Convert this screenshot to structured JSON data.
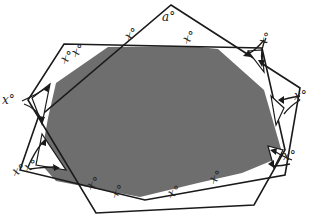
{
  "figure": {
    "overlap_color": "#6e6e6e",
    "line_color": "#1a1a1a",
    "background": "#ffffff"
  },
  "labels": {
    "apex": "a°",
    "top_left_pair": "x°x°",
    "top_right": "x°",
    "upper_right_corner": "x°",
    "right_corner": "x°",
    "lower_right_corner": "x°",
    "bottom_right": "x°",
    "bottom_center": "x°",
    "bottom_left_pair_1": "x°",
    "bottom_left_pair_2": "x°",
    "left_upper_corner": "x°",
    "left_lower_corner": "x°"
  },
  "polygons": {
    "rect_like": [
      [
        64,
        44
      ],
      [
        262,
        48
      ],
      [
        285,
        150
      ],
      [
        254,
        205
      ],
      [
        96,
        213
      ],
      [
        28,
        100
      ]
    ],
    "pentagon": [
      [
        171,
        5
      ],
      [
        300,
        88
      ],
      [
        285,
        175
      ],
      [
        145,
        200
      ],
      [
        20,
        170
      ],
      [
        38,
        118
      ]
    ]
  }
}
